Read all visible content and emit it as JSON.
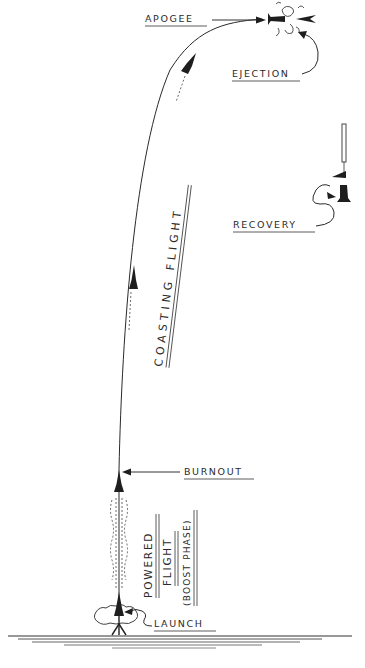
{
  "diagram": {
    "labels": {
      "apogee": "APOGEE",
      "ejection": "EJECTION",
      "recovery": "RECOVERY",
      "coasting_flight": "COASTING FLIGHT",
      "burnout": "BURNOUT",
      "powered": "POWERED",
      "flight": "FLIGHT",
      "boost_phase": "(BOOST PHASE)",
      "launch": "LAUNCH"
    },
    "phases": [
      {
        "name": "Launch",
        "order": 1
      },
      {
        "name": "Powered Flight (Boost Phase)",
        "order": 2
      },
      {
        "name": "Burnout",
        "order": 3
      },
      {
        "name": "Coasting Flight",
        "order": 4
      },
      {
        "name": "Apogee",
        "order": 5
      },
      {
        "name": "Ejection",
        "order": 6
      },
      {
        "name": "Recovery",
        "order": 7
      }
    ],
    "colors": {
      "ink": "#2a2a2a",
      "background": "#ffffff"
    }
  }
}
